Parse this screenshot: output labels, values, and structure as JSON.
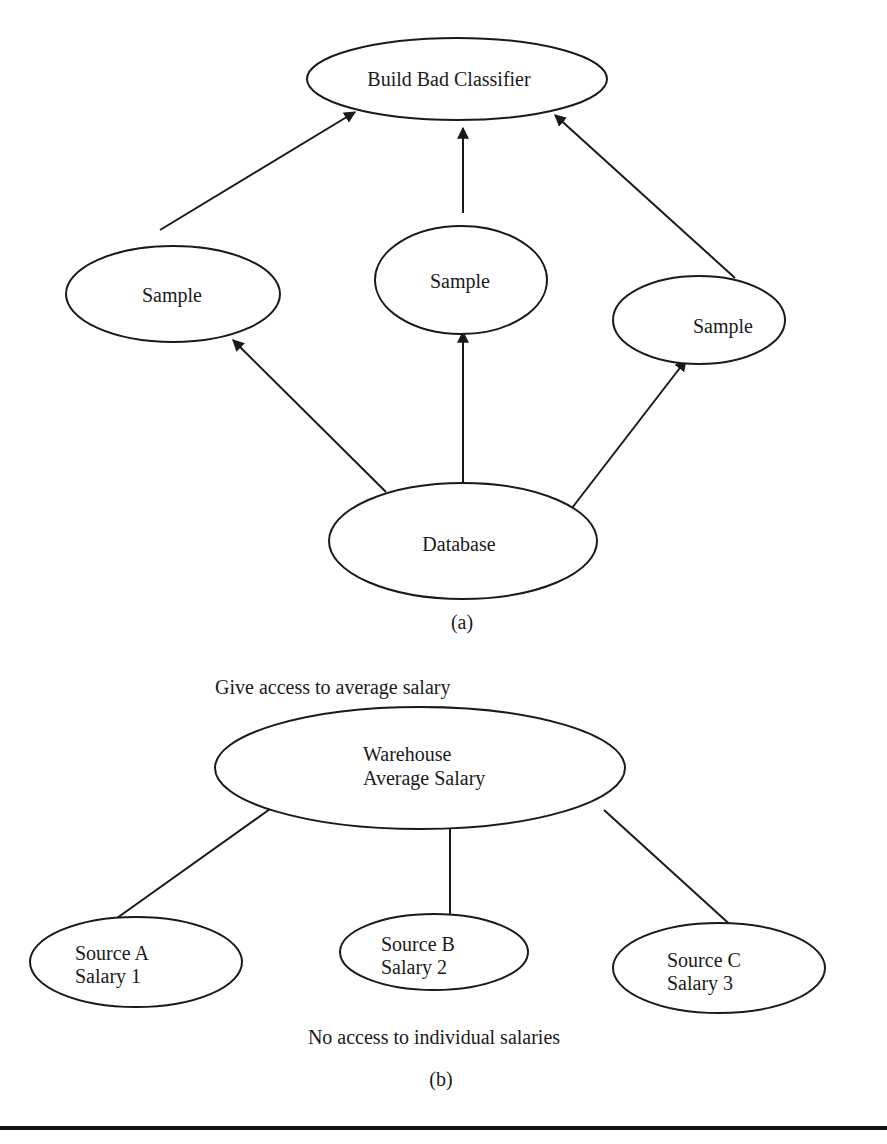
{
  "figure_a": {
    "caption": "(a)",
    "nodes": {
      "classifier": "Build Bad Classifier",
      "sample_left": "Sample",
      "sample_center": "Sample",
      "sample_right": "Sample",
      "database": "Database"
    },
    "edges": [
      {
        "from": "database",
        "to": "sample_left",
        "directed": true
      },
      {
        "from": "database",
        "to": "sample_center",
        "directed": true
      },
      {
        "from": "database",
        "to": "sample_right",
        "directed": true
      },
      {
        "from": "sample_left",
        "to": "classifier",
        "directed": true
      },
      {
        "from": "sample_center",
        "to": "classifier",
        "directed": true
      },
      {
        "from": "sample_right",
        "to": "classifier",
        "directed": true
      }
    ]
  },
  "figure_b": {
    "caption": "(b)",
    "top_annotation": "Give access to average salary",
    "bottom_annotation": "No access to individual salaries",
    "warehouse": {
      "line1": "Warehouse",
      "line2": "Average Salary"
    },
    "sources": [
      {
        "line1": "Source A",
        "line2": "Salary 1"
      },
      {
        "line1": "Source B",
        "line2": "Salary 2"
      },
      {
        "line1": "Source C",
        "line2": "Salary 3"
      }
    ],
    "edges": [
      {
        "from": "warehouse",
        "to": "source_a",
        "directed": false
      },
      {
        "from": "warehouse",
        "to": "source_b",
        "directed": false
      },
      {
        "from": "warehouse",
        "to": "source_c",
        "directed": false
      }
    ]
  },
  "colors": {
    "stroke": "#1a1a1a",
    "background": "#ffffff"
  }
}
